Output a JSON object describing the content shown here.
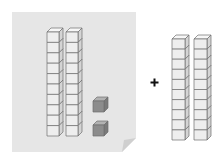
{
  "diagram": {
    "left_group": {
      "tens_rods": 2,
      "ones_cubes": 2,
      "cubes_per_rod": 10
    },
    "operator": "+",
    "right_group": {
      "tens_rods": 2,
      "ones_cubes": 0,
      "cubes_per_rod": 10
    }
  },
  "colors": {
    "paper": "#e6e6e6",
    "paper_fold": "#cfcfcf",
    "rod_front": "#eeeeee",
    "rod_top": "#f7f7f7",
    "rod_side": "#d4d4d4",
    "outline": "#6e6e6e",
    "unit_front": "#8c8c8c",
    "unit_top": "#b2b2b2",
    "unit_side": "#7a7a7a",
    "operator": "#111111"
  }
}
